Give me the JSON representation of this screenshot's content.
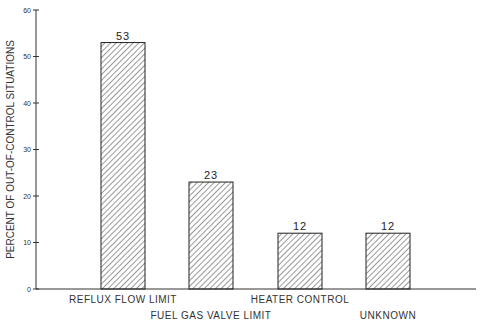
{
  "chart_data": {
    "type": "bar",
    "title": "",
    "xlabel": "",
    "ylabel": "PERCENT OF OUT-OF-CONTROL SITUATIONS",
    "ylim": [
      0,
      60
    ],
    "yticks": [
      0,
      10,
      20,
      30,
      40,
      50,
      60
    ],
    "grid": false,
    "legend": null,
    "categories": [
      "REFLUX FLOW LIMIT",
      "FUEL GAS VALVE LIMIT",
      "HEATER CONTROL",
      "UNKNOWN"
    ],
    "values": [
      53,
      23,
      12,
      12
    ],
    "bar_style": "diagonal-hatch",
    "label_rows": [
      0,
      1,
      0,
      1
    ]
  },
  "colors": {
    "axis": "#333333",
    "bar_edge": "#222222",
    "hatch": "#333333",
    "background": "#ffffff"
  }
}
